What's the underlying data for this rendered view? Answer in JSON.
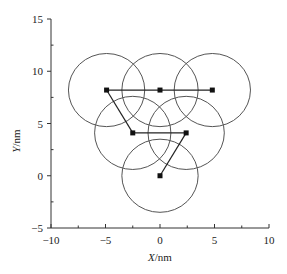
{
  "chart_data": {
    "type": "scatter",
    "title": "",
    "xlabel": "X/nm",
    "ylabel": "Y/nm",
    "xlim": [
      -10,
      10
    ],
    "ylim": [
      -5,
      15
    ],
    "xticks": [
      -10,
      -5,
      0,
      5,
      10
    ],
    "yticks": [
      -5,
      0,
      5,
      10,
      15
    ],
    "grid": false,
    "legend": null,
    "points": [
      {
        "id": "A",
        "x": -4.9,
        "y": 8.2
      },
      {
        "id": "B",
        "x": 0.0,
        "y": 8.2
      },
      {
        "id": "C",
        "x": 4.8,
        "y": 8.2
      },
      {
        "id": "D",
        "x": -2.5,
        "y": 4.1
      },
      {
        "id": "E",
        "x": 2.4,
        "y": 4.1
      },
      {
        "id": "F",
        "x": 0.0,
        "y": 0.0
      }
    ],
    "connections": [
      [
        "A",
        "B"
      ],
      [
        "B",
        "C"
      ],
      [
        "A",
        "D"
      ],
      [
        "D",
        "E"
      ],
      [
        "E",
        "F"
      ]
    ],
    "circles": {
      "radius_nm": 3.5,
      "centered_on": "each point"
    }
  },
  "axes": {
    "x_ticks": [
      "-10",
      "-5",
      "0",
      "5",
      "10"
    ],
    "y_ticks": [
      "-5",
      "0",
      "5",
      "10",
      "15"
    ],
    "x_label": "X/nm",
    "y_label": "Y/nm"
  }
}
